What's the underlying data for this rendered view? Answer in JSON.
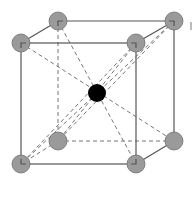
{
  "diagram": {
    "colors": {
      "corner_atom": "#9a9a9a",
      "center_atom": "#000000",
      "edge": "#555555",
      "diagonal": "#777777",
      "background": "#ffffff"
    },
    "atoms": {
      "corners": [
        {
          "id": "back-top-left",
          "x": 58,
          "y": 21
        },
        {
          "id": "back-top-right",
          "x": 174,
          "y": 21
        },
        {
          "id": "front-top-left",
          "x": 21,
          "y": 43
        },
        {
          "id": "front-top-right",
          "x": 136,
          "y": 43
        },
        {
          "id": "back-bottom-left",
          "x": 58,
          "y": 141
        },
        {
          "id": "back-bottom-right",
          "x": 174,
          "y": 141
        },
        {
          "id": "front-bottom-left",
          "x": 21,
          "y": 164
        },
        {
          "id": "front-bottom-right",
          "x": 136,
          "y": 164
        }
      ],
      "center": {
        "id": "body-center",
        "x": 97,
        "y": 93
      },
      "radius": 9
    }
  }
}
